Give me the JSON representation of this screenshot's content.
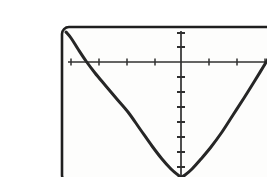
{
  "figure": {
    "name": "parabola-graph",
    "caption": "",
    "background_color": "#ffffff",
    "ink_color": "#1a1a1a",
    "frame": {
      "x": 22,
      "y": 11,
      "width": 229,
      "height": 155,
      "corner_radius": 7,
      "stroke_width": 2.6,
      "color": "#1f1f1f"
    },
    "plot_surface_color": "#fdfdfc"
  },
  "chart_data": {
    "type": "line",
    "title": "",
    "subtitle": "",
    "xlabel": "",
    "ylabel": "",
    "grid": false,
    "legend": null,
    "legend_position": "none",
    "curve_label": "upward-opening parabola",
    "equation": "y = a*x^2",
    "vertex": [
      0,
      -7.7
    ],
    "xlim": [
      -4.3,
      4.0
    ],
    "ylim": [
      -7.7,
      2.3
    ],
    "x_axis_value": 0,
    "y_axis_value": 0,
    "x_tick_step": 1,
    "y_tick_step": 1,
    "x_tick_values": [
      -4,
      -3,
      -2,
      -1,
      0,
      1,
      2,
      3
    ],
    "y_tick_values": [
      2,
      1,
      0,
      -1,
      -2,
      -3,
      -4,
      -5,
      -6,
      -7
    ],
    "x_tick_labels": [],
    "y_tick_labels": [],
    "x": [
      -4.3,
      -4.0,
      -3.5,
      -3.0,
      -2.5,
      -2.0,
      -1.5,
      -1.0,
      -0.5,
      0.0,
      0.5,
      1.0,
      1.5,
      2.0,
      2.5,
      3.0,
      3.5,
      4.0
    ],
    "y": [
      0.0,
      -0.55,
      -2.15,
      -3.4,
      -4.4,
      -5.35,
      -6.2,
      -6.9,
      -7.45,
      -7.7,
      -7.45,
      -6.9,
      -6.2,
      -5.35,
      -4.4,
      -3.4,
      -2.15,
      -0.2
    ],
    "series": [
      {
        "name": "parabola",
        "color": "#262626",
        "stroke_width": 3.0,
        "values": [
          0.0,
          -0.55,
          -2.15,
          -3.4,
          -4.4,
          -5.35,
          -6.2,
          -6.9,
          -7.45,
          -7.7,
          -7.45,
          -6.9,
          -6.2,
          -5.35,
          -4.4,
          -3.4,
          -2.15,
          -0.2
        ]
      }
    ],
    "axes": {
      "x_axis": {
        "name": "x-axis",
        "pixel_y": 46,
        "pixel_x_start": 31,
        "pixel_x_end": 243,
        "stroke_width": 1.5,
        "color": "#303030",
        "tick_length": 7,
        "tick_pixel_xs": [
          31,
          59,
          87,
          115,
          141,
          169,
          197,
          225,
          243
        ]
      },
      "y_axis": {
        "name": "y-axis",
        "pixel_x": 141,
        "pixel_y_start": 17,
        "pixel_y_end": 165,
        "stroke_width": 1.6,
        "color": "#303030",
        "tick_length": 8,
        "tick_pixel_ys": [
          17,
          31,
          46,
          61,
          76,
          91,
          106,
          121,
          136,
          151
        ]
      }
    },
    "curve_pixel_points": [
      [
        26,
        16
      ],
      [
        31,
        22
      ],
      [
        38,
        33
      ],
      [
        46,
        45
      ],
      [
        55,
        57
      ],
      [
        65,
        69
      ],
      [
        76,
        82
      ],
      [
        88,
        96
      ],
      [
        100,
        113
      ],
      [
        112,
        130
      ],
      [
        122,
        143
      ],
      [
        131,
        153
      ],
      [
        138,
        159
      ],
      [
        141,
        161
      ],
      [
        145,
        159
      ],
      [
        152,
        153
      ],
      [
        161,
        143
      ],
      [
        171,
        131
      ],
      [
        182,
        116
      ],
      [
        193,
        99
      ],
      [
        204,
        82
      ],
      [
        214,
        66
      ],
      [
        225,
        48
      ],
      [
        235,
        31
      ],
      [
        244,
        17
      ],
      [
        248,
        12
      ]
    ]
  }
}
